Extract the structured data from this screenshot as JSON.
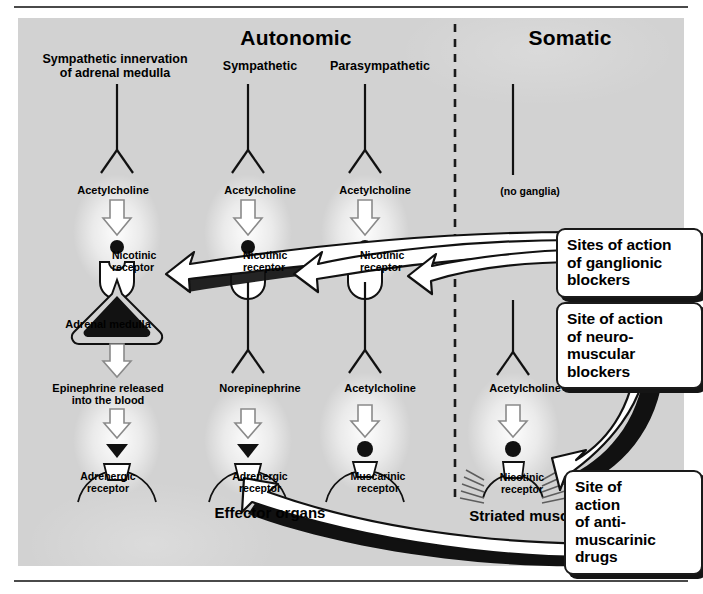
{
  "figure": {
    "headers": {
      "autonomic": "Autonomic",
      "somatic": "Somatic"
    },
    "columns": [
      {
        "id": "sympathetic-adrenal",
        "label": "Sympathetic innervation\nof adrenal medulla"
      },
      {
        "id": "sympathetic",
        "label": "Sympathetic"
      },
      {
        "id": "parasympathetic",
        "label": "Parasympathetic"
      },
      {
        "id": "somatic",
        "label": "(no ganglia)"
      }
    ],
    "transmitters": {
      "ach_sympathetic_adrenal": "Acetylcholine",
      "ach_sympathetic": "Acetylcholine",
      "ach_parasympathetic": "Acetylcholine",
      "epinephrine": "Epinephrine released\ninto the blood",
      "norepinephrine": "Norepinephrine",
      "ach_postganglionic_para": "Acetylcholine",
      "ach_somatic": "Acetylcholine"
    },
    "receptors": {
      "nicotinic_adrenal": "Nicotinic\nreceptor",
      "nicotinic_sympathetic": "Nicotinic\nreceptor",
      "nicotinic_parasympathetic": "Nicotinic\nreceptor",
      "adrenergic_adrenal": "Adrenergic\nreceptor",
      "adrenergic_sympathetic": "Adrenergic\nreceptor",
      "muscarinic": "Muscarinic\nreceptor",
      "nicotinic_muscle": "Nicotinic\nreceptor"
    },
    "organs": {
      "adrenal_medulla": "Adrenal medulla",
      "effector_organs": "Effector organs",
      "striated_muscle": "Striated muscle"
    },
    "callouts": [
      {
        "id": "ganglionic-blockers",
        "text": "Sites of action\nof ganglionic\nblockers"
      },
      {
        "id": "neuromuscular-blockers",
        "text": "Site of action\nof neuro-\nmuscular\nblockers"
      },
      {
        "id": "antimuscarinic-drugs",
        "text": "Site of\naction\nof anti-\nmuscarinic\ndrugs"
      }
    ],
    "colors": {
      "panel_background": "#d2d2d2",
      "ink": "#000000",
      "callout_fill": "#ffffff",
      "callout_shadow": "#151515",
      "divider": "#1a1a1a"
    }
  }
}
